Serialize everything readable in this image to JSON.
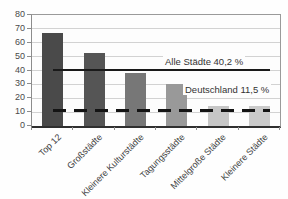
{
  "chart_data": {
    "type": "bar",
    "title": "",
    "xlabel": "",
    "ylabel": "",
    "categories": [
      "Top 12",
      "Großstädte",
      "Kleinere Kulturstädte",
      "Tagungsstädte",
      "Mittelgroße Städte",
      "Kleinere Städte"
    ],
    "values": [
      67,
      52.5,
      38.5,
      30,
      14.5,
      14.5
    ],
    "bar_colors": [
      "#4a4a4a",
      "#555555",
      "#777777",
      "#999999",
      "#c6c6c6",
      "#cacaca"
    ],
    "ylim": [
      0,
      80
    ],
    "y_ticks": [
      0,
      10,
      20,
      30,
      40,
      50,
      60,
      70,
      80
    ],
    "grid": true,
    "legend_position": "none",
    "reference_lines": [
      {
        "label": "Alle Städte 40,2 %",
        "value": 40.2,
        "style": "solid",
        "color": "#1a1a1a"
      },
      {
        "label": "Deutschland 11,5 %",
        "value": 11.5,
        "style": "dashed",
        "color": "#141414"
      }
    ]
  }
}
